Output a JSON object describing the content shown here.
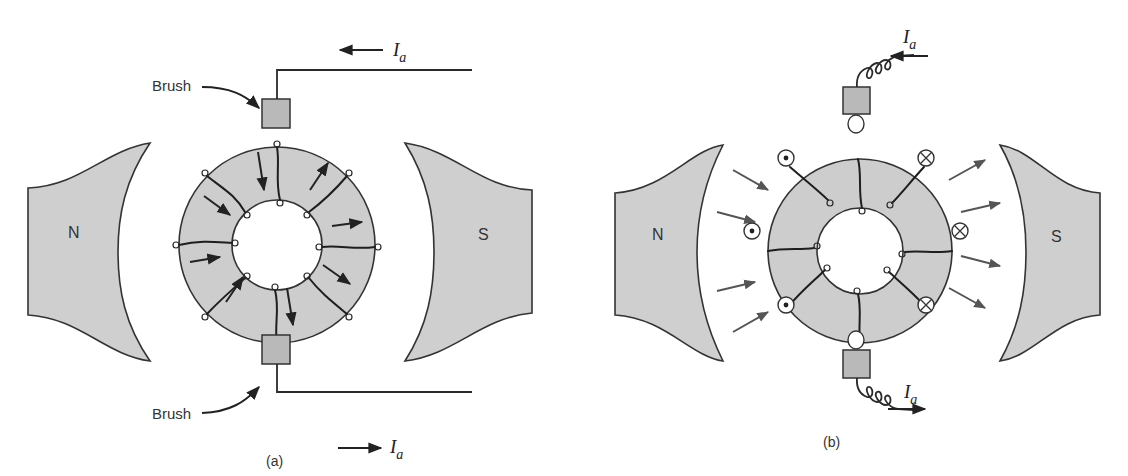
{
  "figure_a": {
    "caption": "(a)",
    "pole_north_label": "N",
    "pole_south_label": "S",
    "brush_top_label": "Brush",
    "brush_bottom_label": "Brush",
    "current_top_label": "I",
    "current_top_subscript": "a",
    "current_top_direction": "left",
    "current_bottom_label": "I",
    "current_bottom_subscript": "a",
    "current_bottom_direction": "right",
    "coil_count": 8
  },
  "figure_b": {
    "caption": "(b)",
    "pole_north_label": "N",
    "pole_south_label": "S",
    "current_top_label": "I",
    "current_top_subscript": "a",
    "current_top_direction": "left",
    "current_bottom_label": "I",
    "current_bottom_subscript": "a",
    "current_bottom_direction": "right",
    "dot_symbols": 3,
    "cross_symbols": 3,
    "flux_arrows_left": 4,
    "flux_arrows_right": 4
  },
  "colors": {
    "fill_gray": "#cdcdcd",
    "stroke": "#333333",
    "background": "#ffffff"
  }
}
